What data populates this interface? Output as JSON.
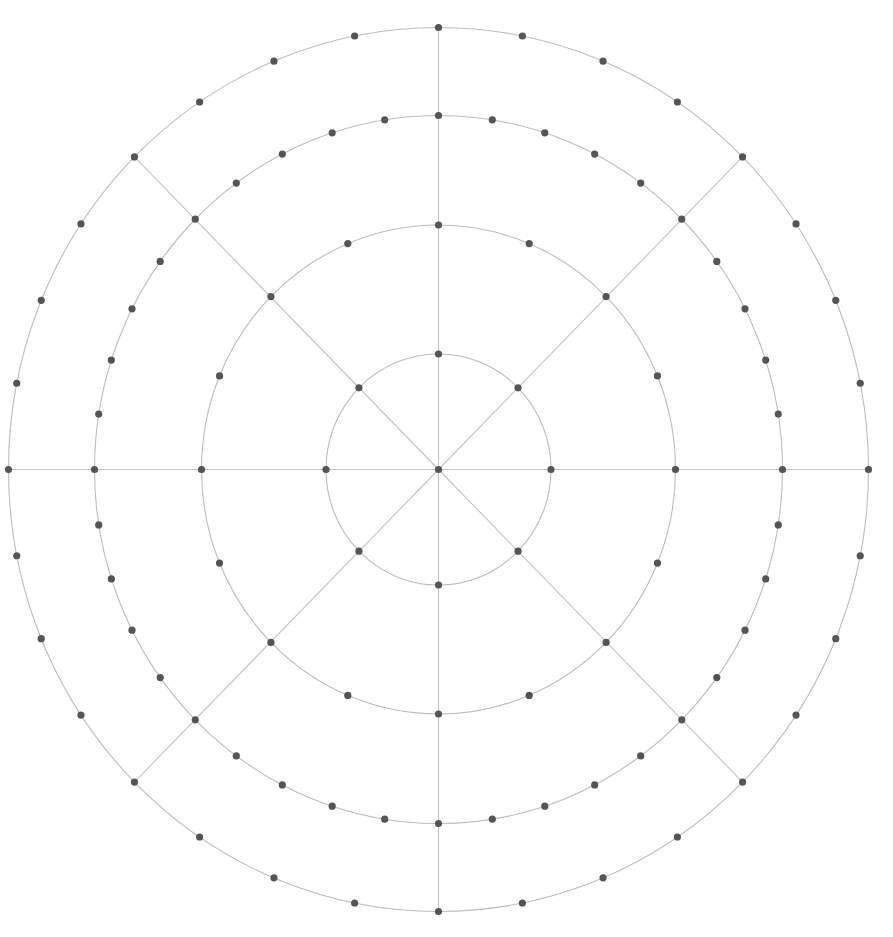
{
  "diagram": {
    "type": "polar-grid",
    "center": {
      "x": 438.5,
      "y": 469.5
    },
    "colors": {
      "ring": "#bdbdbd",
      "spoke": "#c4c4c4",
      "node": "#555555",
      "background": "#ffffff"
    },
    "node_radius": 3.6,
    "spokes": {
      "count": 8,
      "start_angle_deg": 0,
      "extends_to_ring": 3
    },
    "rings": [
      {
        "name": "ring-1",
        "rx": 112.5,
        "ry": 115.5,
        "node_count": 8
      },
      {
        "name": "ring-2",
        "rx": 237,
        "ry": 244.5,
        "node_count": 16
      },
      {
        "name": "ring-3",
        "rx": 344,
        "ry": 354,
        "node_count": 40
      },
      {
        "name": "ring-4",
        "rx": 430,
        "ry": 442,
        "node_count": 32
      }
    ]
  }
}
